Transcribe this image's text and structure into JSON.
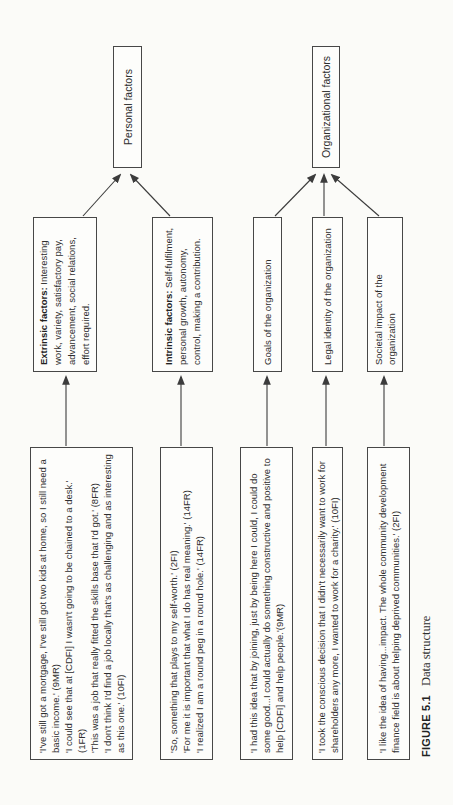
{
  "caption": {
    "label": "FIGURE 5.1",
    "title": "Data structure"
  },
  "colors": {
    "page_bg": "#fbfbf8",
    "box_bg": "#fdfdfb",
    "box_border": "#474747",
    "line": "#3c3c3c",
    "ink": "#2e2e2e"
  },
  "quotes": [
    {
      "id": "q1",
      "items": [
        "'I've still got a mortgage, I've still got two kids at home, so I still need a basic income.' (9MR)",
        "'I could see that at [CDFI] I wasn't going to be chained to a desk.' (1FR)",
        "'This was a job that really fitted the skills base that I'd got.' (8FR)",
        "'I don't think I'd find a job locally that's as challenging and as interesting as this one.' (10FI)"
      ]
    },
    {
      "id": "q2",
      "items": [
        "'So, something that plays to my self-worth.' (2FI)",
        "'For me it is important that what I do has real meaning.' (14FR)",
        "'I realized I am a round peg in a round hole.' (14FR)"
      ]
    },
    {
      "id": "q3",
      "items": [
        "'I had this idea that by joining, just by being here I could, I could do some good...I could actually do something constructive and positive to help [CDFI] and help people.'(9MR)"
      ]
    },
    {
      "id": "q4",
      "items": [
        "'I took the conscious decision that I didn't necessarily want to work for shareholders any more, I wanted to work for a charity.' (10FI)"
      ]
    },
    {
      "id": "q5",
      "items": [
        "'I like the idea of having...impact. The whole community development finance field is about helping deprived communities.' (2FI)"
      ]
    }
  ],
  "themes": [
    {
      "id": "extrinsic",
      "bold": "Extrinsic factors:",
      "text": " Interesting work, variety, satisfactory pay, advancement, social relations, effort required."
    },
    {
      "id": "intrinsic",
      "bold": "Intrinsic factors:",
      "text": " Self-fulfilment, personal growth, autonomy, control, making a contribution."
    },
    {
      "id": "goals",
      "text": "Goals of the organization"
    },
    {
      "id": "legal",
      "text": "Legal identity of the organization"
    },
    {
      "id": "societal",
      "text": "Societal impact of the organization"
    }
  ],
  "outcomes": [
    {
      "id": "personal",
      "label": "Personal factors"
    },
    {
      "id": "organizational",
      "label": "Organizational factors"
    }
  ],
  "connections": [
    {
      "from": "q1",
      "to": "extrinsic"
    },
    {
      "from": "q2",
      "to": "intrinsic"
    },
    {
      "from": "q3",
      "to": "goals"
    },
    {
      "from": "q4",
      "to": "legal"
    },
    {
      "from": "q5",
      "to": "societal"
    },
    {
      "from": "extrinsic",
      "to": "personal"
    },
    {
      "from": "intrinsic",
      "to": "personal"
    },
    {
      "from": "goals",
      "to": "organizational"
    },
    {
      "from": "legal",
      "to": "organizational"
    },
    {
      "from": "societal",
      "to": "organizational"
    }
  ]
}
